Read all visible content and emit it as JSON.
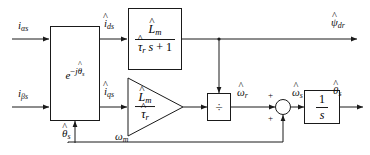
{
  "diagram": {
    "type": "control-block-diagram",
    "stroke_color": "#1a1a1a",
    "background_color": "#ffffff"
  },
  "inputs": {
    "alpha_current": {
      "base": "i",
      "sub": "αs",
      "hat": false
    },
    "beta_current": {
      "base": "i",
      "sub": "βs",
      "hat": false
    },
    "mechanical_speed": {
      "base": "ω",
      "sub": "m",
      "hat": false
    }
  },
  "internal_signals": {
    "d_axis_current": {
      "base": "i",
      "sub": "ds",
      "hat": true
    },
    "q_axis_current": {
      "base": "i",
      "sub": "qs",
      "hat": true
    },
    "slip_speed": {
      "base": "ω",
      "sub": "r",
      "hat": true
    },
    "sync_speed": {
      "base": "ω",
      "sub": "s",
      "hat": true
    },
    "theta_feedback": {
      "base": "θ",
      "sub": "s",
      "hat": true
    }
  },
  "outputs": {
    "rotor_flux": {
      "base": "ψ",
      "sub": "dr",
      "hat": true
    },
    "flux_angle": {
      "base": "θ",
      "sub": "s",
      "hat": true
    }
  },
  "blocks": {
    "rotation": {
      "name": "inverse-park-transform",
      "expr_base": "e",
      "expr_exp_prefix": "−j",
      "expr_exp_base": "θ",
      "expr_exp_sub": "s",
      "expr_exp_hat": true
    },
    "flux_lag": {
      "name": "magnetizing-inductance-lag",
      "numerator": {
        "base": "L",
        "sub": "m",
        "hat": true
      },
      "denominator_tau": {
        "base": "τ",
        "sub": "r",
        "hat": true
      },
      "denominator_rest": "s + 1"
    },
    "gain_triangle": {
      "name": "lm-over-tau-r-gain",
      "numerator": {
        "base": "L",
        "sub": "m",
        "hat": true
      },
      "denominator": {
        "base": "τ",
        "sub": "r",
        "hat": true
      }
    },
    "divider": {
      "name": "division-block",
      "symbol": "÷"
    },
    "summer": {
      "name": "speed-summing-junction",
      "sign_top": "+",
      "sign_bottom": "+"
    },
    "integrator": {
      "name": "integrator-block",
      "numerator": "1",
      "denominator": "s"
    }
  }
}
